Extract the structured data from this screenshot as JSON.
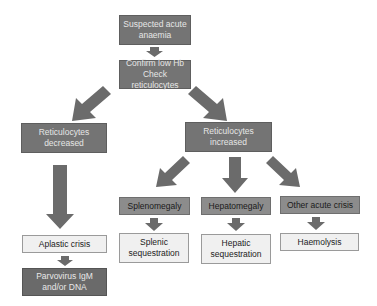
{
  "diagram": {
    "type": "flowchart",
    "colors": {
      "dark_box": "#747474",
      "mid_box": "#8c8c8c",
      "light_box": "#f0f0f0",
      "arrow": "#6b6b6b"
    },
    "nodes": {
      "suspected": "Suspected acute anaemia",
      "confirm_line1": "Confirm low Hb",
      "confirm_line2": "Check reticulocytes",
      "retic_decreased_line1": "Reticulocytes",
      "retic_decreased_line2": "decreased",
      "retic_increased_line1": "Reticulocytes",
      "retic_increased_line2": "increased",
      "splenomegaly": "Splenomegaly",
      "hepatomegaly": "Hepatomegaly",
      "other_crisis": "Other acute crisis",
      "splenic_line1": "Splenic",
      "splenic_line2": "sequestration",
      "hepatic_line1": "Hepatic",
      "hepatic_line2": "sequestration",
      "haemolysis": "Haemolysis",
      "aplastic": "Aplastic crisis",
      "parvo_line1": "Parvovirus IgM",
      "parvo_line2": "and/or DNA"
    },
    "edges": [
      [
        "suspected",
        "confirm"
      ],
      [
        "confirm",
        "retic_decreased"
      ],
      [
        "confirm",
        "retic_increased"
      ],
      [
        "retic_decreased",
        "aplastic"
      ],
      [
        "aplastic",
        "parvo"
      ],
      [
        "retic_increased",
        "splenomegaly"
      ],
      [
        "retic_increased",
        "hepatomegaly"
      ],
      [
        "retic_increased",
        "other_crisis"
      ],
      [
        "splenomegaly",
        "splenic"
      ],
      [
        "hepatomegaly",
        "hepatic"
      ],
      [
        "other_crisis",
        "haemolysis"
      ]
    ]
  }
}
